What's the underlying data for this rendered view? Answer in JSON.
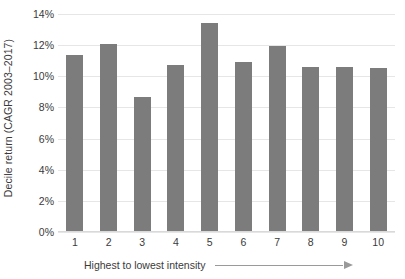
{
  "chart_data": {
    "type": "bar",
    "title": "",
    "subtitle": "",
    "xlabel": "Highest to lowest intensity",
    "ylabel": "Decile return (CAGR 2003–2017)",
    "categories": [
      "1",
      "2",
      "3",
      "4",
      "5",
      "6",
      "7",
      "8",
      "9",
      "10"
    ],
    "values": [
      11.35,
      12.05,
      8.65,
      10.7,
      13.4,
      10.95,
      11.95,
      10.6,
      10.6,
      10.55
    ],
    "value_labels": [
      "11.35%",
      "12.05%",
      "8.65%",
      "10.7%",
      "13.4%",
      "10.95%",
      "11.95%",
      "10.6%",
      "10.6%",
      "10.55%"
    ],
    "ylim": [
      0,
      14
    ],
    "y_ticks": [
      0,
      2,
      4,
      6,
      8,
      10,
      12,
      14
    ],
    "y_tick_labels": [
      "0%",
      "2%",
      "4%",
      "6%",
      "8%",
      "10%",
      "12%",
      "14%"
    ],
    "grid": true,
    "grid_axis": "y",
    "legend": null,
    "legend_position": "none",
    "bar_color": "#7c7c7c",
    "gridline_color": "#e6e6e6",
    "text_color": "#3a3a3a",
    "background_color": "#ffffff",
    "annotations": [
      {
        "name": "direction-arrow",
        "shape": "arrow-right",
        "color": "#9a9a9a",
        "follows": "Highest to lowest intensity"
      }
    ]
  }
}
